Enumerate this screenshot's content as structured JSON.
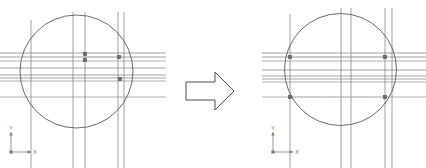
{
  "figure": {
    "background_color": "#ffffff",
    "width": 426,
    "height": 168
  },
  "style": {
    "circle_stroke": "#595959",
    "construction_line_stroke": "#7a7a7a",
    "guide_line_stroke": "#8c8c8c",
    "dotted_line_stroke": "#a8a8a8",
    "point_fill": "#6f6f6f",
    "point_stroke": "#4a4a4a",
    "arrow_stroke": "#4d4d4d",
    "arrow_fill": "#ffffff",
    "axis_stroke": "#7d7d7d",
    "axis_text_color": "#6b6b6b"
  },
  "panels": [
    {
      "id": "before",
      "name": "before-sketch",
      "circle": {
        "cx": 76.5,
        "cy": 71.5,
        "r": 56.5
      },
      "vertical_lines": [
        {
          "x": 31,
          "y1": 20,
          "y2": 168,
          "weight": 0.7
        },
        {
          "x": 73,
          "y1": 12,
          "y2": 168,
          "weight": 0.7
        },
        {
          "x": 85,
          "y1": 12,
          "y2": 168,
          "weight": 0.7
        },
        {
          "x": 118,
          "y1": 12,
          "y2": 168,
          "weight": 0.7
        },
        {
          "x": 124,
          "y1": 12,
          "y2": 168,
          "weight": 0.7
        }
      ],
      "horizontal_lines": [
        {
          "y": 53,
          "x1": 0,
          "x2": 166,
          "weight": 0.7
        },
        {
          "y": 57,
          "x1": 0,
          "x2": 166,
          "weight": 0.7
        },
        {
          "y": 61,
          "x1": 0,
          "x2": 166,
          "weight": 0.6
        },
        {
          "y": 68,
          "x1": 0,
          "x2": 166,
          "weight": 0.7
        },
        {
          "y": 75,
          "x1": 0,
          "x2": 166,
          "weight": 0.7
        },
        {
          "y": 78,
          "x1": 0,
          "x2": 166,
          "weight": 0.7
        },
        {
          "y": 81,
          "x1": 0,
          "x2": 166,
          "weight": 0.6
        },
        {
          "y": 97,
          "x1": 0,
          "x2": 166,
          "weight": 0.6
        }
      ],
      "dotted_lines": [
        {
          "y": 57,
          "x1": 85,
          "x2": 119
        }
      ],
      "points": [
        {
          "id": "p1",
          "x": 85,
          "y": 54
        },
        {
          "id": "p2",
          "x": 85,
          "y": 60
        },
        {
          "id": "p3",
          "x": 119,
          "y": 57
        },
        {
          "id": "p4",
          "x": 120,
          "y": 79
        }
      ],
      "axis_indicator": {
        "origin_x": 11,
        "origin_y": 152,
        "arm_length": 20,
        "x_label": "X",
        "y_label": "Y",
        "origin_label": ""
      }
    },
    {
      "id": "after",
      "name": "after-sketch",
      "circle": {
        "cx": 340.5,
        "cy": 69.5,
        "r": 56.0
      },
      "vertical_lines": [
        {
          "x": 290,
          "y1": 14,
          "y2": 168,
          "weight": 0.7
        },
        {
          "x": 341,
          "y1": 8,
          "y2": 168,
          "weight": 0.7
        },
        {
          "x": 351,
          "y1": 8,
          "y2": 168,
          "weight": 0.7
        },
        {
          "x": 385,
          "y1": 8,
          "y2": 168,
          "weight": 0.7
        },
        {
          "x": 392,
          "y1": 8,
          "y2": 168,
          "weight": 0.7
        }
      ],
      "horizontal_lines": [
        {
          "y": 53,
          "x1": 262,
          "x2": 426,
          "weight": 0.7
        },
        {
          "y": 57,
          "x1": 262,
          "x2": 426,
          "weight": 0.7
        },
        {
          "y": 61,
          "x1": 262,
          "x2": 426,
          "weight": 0.6
        },
        {
          "y": 70,
          "x1": 262,
          "x2": 426,
          "weight": 0.7
        },
        {
          "y": 76,
          "x1": 262,
          "x2": 426,
          "weight": 0.7
        },
        {
          "y": 79,
          "x1": 262,
          "x2": 426,
          "weight": 0.7
        },
        {
          "y": 82,
          "x1": 262,
          "x2": 426,
          "weight": 0.6
        },
        {
          "y": 97,
          "x1": 262,
          "x2": 426,
          "weight": 0.6
        }
      ],
      "dotted_lines": [
        {
          "y": 57,
          "x1": 290,
          "x2": 385
        },
        {
          "y": 97,
          "x1": 290,
          "x2": 385
        }
      ],
      "points": [
        {
          "id": "q1",
          "x": 290,
          "y": 57
        },
        {
          "id": "q2",
          "x": 385,
          "y": 57
        },
        {
          "id": "q3",
          "x": 290,
          "y": 97
        },
        {
          "id": "q4",
          "x": 385,
          "y": 97
        }
      ],
      "axis_indicator": {
        "origin_x": 273,
        "origin_y": 152,
        "arm_length": 20,
        "x_label": "X",
        "y_label": "Y",
        "origin_label": ""
      }
    }
  ],
  "transform_arrow": {
    "name": "transform-arrow",
    "direction": "right",
    "bounds": {
      "x": 185,
      "y": 72,
      "width": 50,
      "height": 38
    },
    "points": "186,82 215,82 215,72 234,91 215,110 215,100 186,100"
  }
}
